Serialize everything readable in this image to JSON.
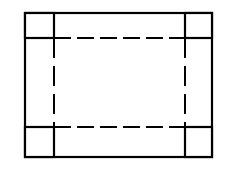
{
  "figure": {
    "name": "box-development-diagram",
    "type": "technical-line-drawing",
    "canvas": {
      "width": 234,
      "height": 179,
      "background_color": "#ffffff"
    },
    "style": {
      "stroke_color": "#000000",
      "fill_color": "#ffffff",
      "solid_stroke_width": 2.2,
      "dashed_stroke_width": 2.0,
      "dash_horizontal": "17 6",
      "dash_vertical": "20 8"
    },
    "outer_rectangle": {
      "label": "outer-rectangle",
      "x": 25,
      "y": 13,
      "width": 187,
      "height": 144
    },
    "inner_dashed_rectangle": {
      "label": "inner-dashed-rectangle",
      "x": 54,
      "y": 38,
      "width": 131,
      "height": 89
    },
    "corner_squares": [
      {
        "label": "corner-square-top-left",
        "position": "top-left",
        "x": 25,
        "y": 13,
        "width": 29,
        "height": 25
      },
      {
        "label": "corner-square-top-right",
        "position": "top-right",
        "x": 185,
        "y": 13,
        "width": 27,
        "height": 25
      },
      {
        "label": "corner-square-bottom-left",
        "position": "bottom-left",
        "x": 25,
        "y": 127,
        "width": 29,
        "height": 30
      },
      {
        "label": "corner-square-bottom-right",
        "position": "bottom-right",
        "x": 185,
        "y": 127,
        "width": 27,
        "height": 30
      }
    ]
  }
}
